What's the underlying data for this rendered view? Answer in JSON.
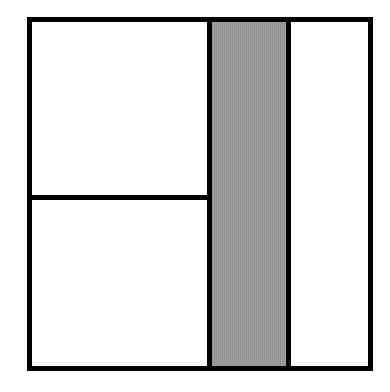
{
  "diagram": {
    "colors": {
      "stroke": "#000000",
      "fill": "#ffffff",
      "shaded": "#9a9a9a"
    },
    "regions": [
      {
        "name": "top-left",
        "shaded": false
      },
      {
        "name": "bottom-left",
        "shaded": false
      },
      {
        "name": "middle-strip",
        "shaded": true
      },
      {
        "name": "right-strip",
        "shaded": false
      }
    ]
  }
}
